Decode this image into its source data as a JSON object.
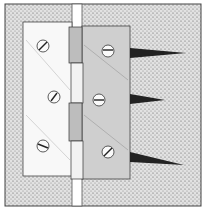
{
  "illustration": {
    "subject": "Butt hinge mounted across door and jamb",
    "colors": {
      "background": "#ffffff",
      "stipple": "#d9d9d9",
      "stipple_dot": "#6a6a6a",
      "left_leaf": "#f7f7f7",
      "right_leaf": "#cfcfcf",
      "outline": "#333333",
      "gap": "#ffffff",
      "screw_shadow": "#222222"
    },
    "left_leaf_screws": 3,
    "right_leaf_screws": 3,
    "screw_spikes": 3
  }
}
